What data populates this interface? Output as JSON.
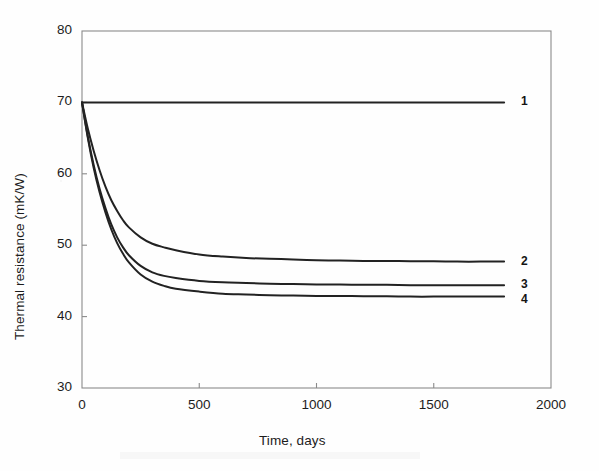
{
  "chart_data": {
    "type": "line",
    "title": "",
    "xlabel": "Time, days",
    "ylabel": "Thermal resistance (mK/W)",
    "xlim": [
      0,
      2000
    ],
    "ylim": [
      30,
      80
    ],
    "xticks": [
      0,
      500,
      1000,
      1500,
      2000
    ],
    "xtick_labels": [
      "0",
      "500",
      "1000",
      "1500",
      "2000"
    ],
    "yticks": [
      30,
      40,
      50,
      60,
      70,
      80
    ],
    "ytick_labels": [
      "30",
      "40",
      "50",
      "60",
      "70",
      "80"
    ],
    "grid": false,
    "legend_position": "right-inline",
    "series": [
      {
        "name": "1",
        "label": "1",
        "color": "#222222",
        "x": [
          0,
          50,
          100,
          150,
          200,
          250,
          300,
          400,
          500,
          600,
          700,
          800,
          900,
          1000,
          1100,
          1200,
          1300,
          1400,
          1500,
          1600,
          1700,
          1800
        ],
        "values": [
          70.0,
          70.0,
          70.0,
          70.0,
          70.0,
          70.0,
          70.0,
          70.0,
          70.0,
          70.0,
          70.0,
          70.0,
          70.0,
          70.0,
          70.0,
          70.0,
          70.0,
          70.0,
          70.0,
          70.0,
          70.0,
          70.0
        ]
      },
      {
        "name": "2",
        "label": "2",
        "color": "#222222",
        "x": [
          0,
          25,
          50,
          75,
          100,
          125,
          150,
          175,
          200,
          250,
          300,
          350,
          400,
          500,
          600,
          700,
          800,
          900,
          1000,
          1100,
          1200,
          1300,
          1400,
          1500,
          1600,
          1700,
          1800
        ],
        "values": [
          70.0,
          66.3,
          63.2,
          60.5,
          58.2,
          56.3,
          54.8,
          53.5,
          52.5,
          51.1,
          50.2,
          49.7,
          49.3,
          48.7,
          48.4,
          48.2,
          48.1,
          48.0,
          47.9,
          47.85,
          47.8,
          47.8,
          47.75,
          47.75,
          47.7,
          47.7,
          47.7
        ]
      },
      {
        "name": "3",
        "label": "3",
        "color": "#222222",
        "x": [
          0,
          25,
          50,
          75,
          100,
          125,
          150,
          175,
          200,
          250,
          300,
          350,
          400,
          500,
          600,
          700,
          800,
          900,
          1000,
          1100,
          1200,
          1300,
          1400,
          1500,
          1600,
          1700,
          1800
        ],
        "values": [
          70.0,
          65.2,
          61.2,
          57.9,
          55.2,
          52.9,
          51.1,
          49.7,
          48.6,
          47.1,
          46.2,
          45.7,
          45.4,
          45.0,
          44.8,
          44.7,
          44.6,
          44.55,
          44.5,
          44.5,
          44.45,
          44.45,
          44.4,
          44.4,
          44.4,
          44.4,
          44.4
        ]
      },
      {
        "name": "4",
        "label": "4",
        "color": "#222222",
        "x": [
          0,
          25,
          50,
          75,
          100,
          125,
          150,
          175,
          200,
          250,
          300,
          350,
          400,
          500,
          600,
          700,
          800,
          900,
          1000,
          1100,
          1200,
          1300,
          1400,
          1500,
          1600,
          1700,
          1800
        ],
        "values": [
          70.0,
          65.0,
          60.8,
          57.4,
          54.6,
          52.2,
          50.3,
          48.8,
          47.6,
          45.9,
          44.9,
          44.3,
          43.9,
          43.5,
          43.2,
          43.1,
          43.0,
          42.95,
          42.9,
          42.9,
          42.85,
          42.85,
          42.8,
          42.8,
          42.8,
          42.8,
          42.8
        ]
      }
    ],
    "series_label_positions": [
      {
        "label": "1",
        "y": 70.0
      },
      {
        "label": "2",
        "y": 47.7
      },
      {
        "label": "3",
        "y": 44.4
      },
      {
        "label": "4",
        "y": 42.3
      }
    ]
  },
  "figure": {
    "background_color": "#fefefe",
    "axis_color": "#8a8a8a",
    "line_color": "#222222",
    "text_color": "#1c1c1c"
  }
}
